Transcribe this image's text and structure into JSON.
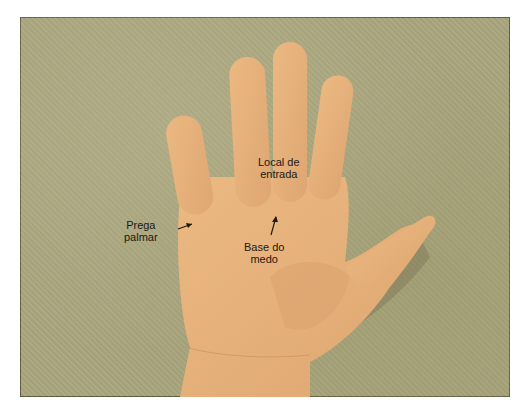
{
  "figure": {
    "colors": {
      "background": "#a9a67e",
      "skin": "#e7b07a",
      "skin_shadow": "#c58e5c",
      "text": "#1d1a12"
    },
    "labels": [
      {
        "id": "local-de-entrada",
        "line1": "Local de",
        "line2": "entrada"
      },
      {
        "id": "prega-palmar",
        "line1": "Prega",
        "line2": "palmar"
      },
      {
        "id": "base-do-medo",
        "line1": "Base do",
        "line2": "medo"
      }
    ]
  }
}
